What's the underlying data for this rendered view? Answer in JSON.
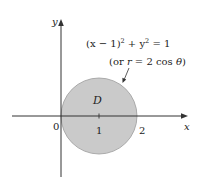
{
  "figure": {
    "axes": {
      "x_label": "x",
      "y_label": "y",
      "origin_label": "0",
      "ticks": [
        {
          "value": "1",
          "label": "1"
        },
        {
          "value": "2",
          "label": "2"
        }
      ]
    },
    "region": {
      "label": "D",
      "fill_color": "#cacaca",
      "stroke_color": "#9a9a9a"
    },
    "annotation": {
      "equation": "(x − 1)² + y² = 1",
      "eq_part1": "(x − 1)",
      "eq_sup1": "2",
      "eq_part2": " + y",
      "eq_sup2": "2",
      "eq_part3": " = 1",
      "polar": "(or r = 2 cos θ)",
      "polar_part1": "(or ",
      "polar_r": "r",
      "polar_part2": " = 2 cos ",
      "polar_theta": "θ",
      "polar_part3": ")"
    },
    "colors": {
      "axis": "#333333",
      "text": "#222222"
    }
  }
}
